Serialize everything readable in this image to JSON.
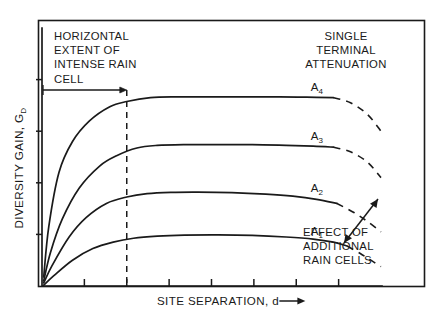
{
  "figure": {
    "background": "#ffffff",
    "ink": "#1a1a1a",
    "frame_visible": true
  },
  "annotations": {
    "horizontal_extent": {
      "lines": [
        "HORIZONTAL",
        "EXTENT OF",
        "INTENSE RAIN",
        "CELL"
      ],
      "arrow_label": "horizontal-extent-arrow"
    },
    "single_terminal": {
      "lines": [
        "SINGLE",
        "TERMINAL",
        "ATTENUATION"
      ]
    },
    "additional_cells": {
      "lines": [
        "EFFECT OF",
        "ADDITIONAL",
        "RAIN CELLS"
      ],
      "arrow_label": "double-headed-arrow"
    }
  },
  "chart_data": {
    "type": "line",
    "title": "",
    "subtitle": "",
    "xlabel": "SITE SEPARATION, d ⟶",
    "ylabel": "DIVERSITY GAIN, G",
    "ylabel_sub": "D",
    "xlabel_plain": "SITE SEPARATION, d",
    "grid": false,
    "legend_position": "inline-right-of-curve",
    "axis_style": "ticks-only-no-numeric-labels",
    "xlim": [
      0,
      10
    ],
    "ylim": [
      0,
      10
    ],
    "x_ticks": [
      1.25,
      2.5,
      3.75,
      5.0,
      6.25,
      7.5,
      8.75
    ],
    "y_ticks": [
      2.0,
      4.0,
      6.0,
      8.0
    ],
    "reference_line": {
      "label": "horizontal extent of intense rain cell",
      "x": 2.5,
      "style": "dashed",
      "y_from": 0,
      "y_to": 7.6
    },
    "series": [
      {
        "name": "A₄",
        "name_plain": "A4",
        "label": "A",
        "label_sub": "4",
        "plateau": 7.3,
        "x": [
          0.05,
          0.2,
          0.5,
          0.9,
          1.4,
          2.0,
          2.5,
          3.2,
          4.0,
          5.0,
          6.0,
          7.0,
          7.8,
          8.6
        ],
        "values": [
          0.35,
          2.3,
          4.4,
          5.6,
          6.4,
          6.95,
          7.15,
          7.3,
          7.33,
          7.33,
          7.33,
          7.33,
          7.32,
          7.3
        ],
        "dashed_tail_x": [
          8.6,
          9.1,
          9.6,
          10.0
        ],
        "dashed_tail_values": [
          7.3,
          7.1,
          6.65,
          6.0
        ]
      },
      {
        "name": "A₃",
        "name_plain": "A3",
        "label": "A",
        "label_sub": "3",
        "plateau": 5.45,
        "x": [
          0.05,
          0.25,
          0.6,
          1.1,
          1.7,
          2.2,
          2.8,
          3.4,
          4.2,
          5.2,
          6.2,
          7.2,
          8.0,
          8.6
        ],
        "values": [
          0.2,
          1.3,
          2.6,
          3.8,
          4.65,
          5.05,
          5.35,
          5.45,
          5.48,
          5.48,
          5.48,
          5.45,
          5.42,
          5.38
        ],
        "dashed_tail_x": [
          8.6,
          9.1,
          9.6,
          10.0
        ],
        "dashed_tail_values": [
          5.38,
          5.2,
          4.8,
          4.2
        ]
      },
      {
        "name": "A₂",
        "name_plain": "A2",
        "label": "A",
        "label_sub": "2",
        "plateau": 3.62,
        "x": [
          0.05,
          0.3,
          0.8,
          1.3,
          1.9,
          2.5,
          3.1,
          3.8,
          4.6,
          5.6,
          6.6,
          7.4,
          8.1,
          8.7
        ],
        "values": [
          0.12,
          0.8,
          1.9,
          2.65,
          3.2,
          3.45,
          3.58,
          3.63,
          3.64,
          3.62,
          3.56,
          3.48,
          3.36,
          3.2
        ],
        "dashed_tail_x": [
          8.7,
          9.2,
          9.6,
          10.0
        ],
        "dashed_tail_values": [
          3.2,
          2.85,
          2.5,
          2.1
        ]
      },
      {
        "name": "A₁",
        "name_plain": "A1",
        "label": "A",
        "label_sub": "1",
        "plateau": 1.95,
        "x": [
          0.05,
          0.35,
          0.9,
          1.5,
          2.1,
          2.7,
          3.4,
          4.2,
          5.2,
          6.2,
          7.2,
          8.0,
          8.6,
          9.0
        ],
        "values": [
          0.03,
          0.4,
          1.0,
          1.45,
          1.7,
          1.85,
          1.93,
          1.97,
          1.98,
          1.96,
          1.9,
          1.82,
          1.7,
          1.55
        ],
        "dashed_tail_x": [
          9.0,
          9.4,
          9.7,
          10.0
        ],
        "dashed_tail_values": [
          1.55,
          1.25,
          1.0,
          0.75
        ]
      }
    ],
    "annotations": [
      {
        "text": "HORIZONTAL EXTENT OF INTENSE RAIN CELL",
        "position": "upper-left"
      },
      {
        "text": "SINGLE TERMINAL ATTENUATION",
        "position": "upper-right"
      },
      {
        "text": "EFFECT OF ADDITIONAL RAIN CELLS",
        "position": "lower-right"
      }
    ]
  }
}
